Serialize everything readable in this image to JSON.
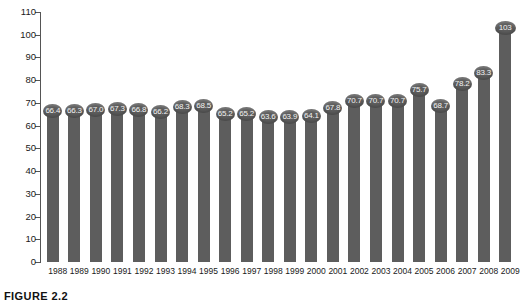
{
  "caption": "FIGURE 2.2",
  "colors": {
    "bar": "#5d5d5d",
    "marker_text": "#f2f2f2",
    "axis": "#555555",
    "background": "#ffffff"
  },
  "chart_data": {
    "type": "bar",
    "title": "",
    "subtitle": "",
    "xlabel": "",
    "ylabel": "",
    "ylim": [
      0,
      110
    ],
    "yticks": [
      0,
      10,
      20,
      30,
      40,
      50,
      60,
      70,
      80,
      90,
      100,
      110
    ],
    "grid": false,
    "legend": false,
    "orientation": "vertical",
    "marker_style": "lollipop-ellipse-with-value-label",
    "categories": [
      "1988",
      "1989",
      "1990",
      "1991",
      "1992",
      "1993",
      "1994",
      "1995",
      "1996",
      "1997",
      "1998",
      "1999",
      "2000",
      "2001",
      "2002",
      "2003",
      "2004",
      "2005",
      "2006",
      "2007",
      "2008",
      "2009"
    ],
    "values": [
      66.4,
      66.3,
      67.0,
      67.3,
      66.8,
      66.2,
      68.3,
      68.5,
      65.2,
      65.2,
      63.6,
      63.9,
      64.1,
      67.8,
      70.7,
      70.7,
      70.7,
      75.7,
      68.7,
      78.2,
      83.3,
      103
    ],
    "labels": [
      "66.4",
      "66.3",
      "67.0",
      "67.3",
      "66.8",
      "66.2",
      "68.3",
      "68.5",
      "65.2",
      "65.2",
      "63.6",
      "63.9",
      "64.1",
      "67.8",
      "70.7",
      "70.7",
      "70.7",
      "75.7",
      "68.7",
      "78.2",
      "83.3",
      "103"
    ]
  }
}
